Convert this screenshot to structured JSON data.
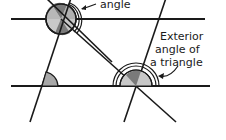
{
  "diagram": {
    "labels": {
      "top": "angle",
      "exterior_line1": "Exterior",
      "exterior_line2": "angle of",
      "exterior_line3": "a triangle"
    },
    "colors": {
      "line": "#1a1a1a",
      "light_fill": "#c8c8c8",
      "dark_fill": "#7a7a7a",
      "background": "#ffffff"
    }
  }
}
